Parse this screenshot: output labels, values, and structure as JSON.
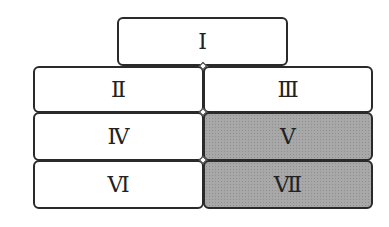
{
  "diagram": {
    "boxes": [
      {
        "id": "I",
        "label": "Ⅰ",
        "shaded": false
      },
      {
        "id": "II",
        "label": "Ⅱ",
        "shaded": false
      },
      {
        "id": "III",
        "label": "Ⅲ",
        "shaded": false
      },
      {
        "id": "IV",
        "label": "Ⅳ",
        "shaded": false
      },
      {
        "id": "V",
        "label": "Ⅴ",
        "shaded": true
      },
      {
        "id": "VI",
        "label": "Ⅵ",
        "shaded": false
      },
      {
        "id": "VII",
        "label": "Ⅶ",
        "shaded": true
      }
    ],
    "colors": {
      "border": "#2a2a2a",
      "shaded_fill": "#a8a8a8",
      "fill": "#ffffff"
    }
  }
}
